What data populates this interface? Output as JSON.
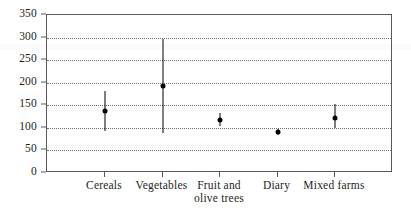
{
  "chart_data": {
    "type": "scatter",
    "title": "",
    "subtitle": "",
    "xlabel": "",
    "ylabel": "",
    "grid": true,
    "legend": false,
    "legend_position": "none",
    "ylim": [
      0,
      350
    ],
    "yticks": [
      0,
      50,
      100,
      150,
      200,
      250,
      300,
      350
    ],
    "ytick_labels": [
      "0",
      "50",
      "100",
      "150",
      "200",
      "250",
      "300",
      "350"
    ],
    "categories": [
      "Cereals",
      "Vegetables",
      "Fruit and\nolive trees",
      "Diary",
      "Mixed farms"
    ],
    "series": [
      {
        "name": "mean",
        "values": [
          138,
          192,
          118,
          91,
          121
        ],
        "errors_low": [
          93,
          88,
          105,
          85,
          100
        ],
        "errors_high": [
          182,
          296,
          132,
          98,
          152
        ]
      }
    ],
    "marker": "filled-circle",
    "errorbar_style": "vertical-line",
    "colors": {
      "marker": "#000000",
      "errorbar": "#000000",
      "gridline": "#6d6e71",
      "axis": "#58595b",
      "text": "#231f20",
      "background": "#ffffff"
    }
  },
  "axes": {
    "y_ticks": [
      {
        "label": "350",
        "value": 350
      },
      {
        "label": "300",
        "value": 300
      },
      {
        "label": "250",
        "value": 250
      },
      {
        "label": "200",
        "value": 200
      },
      {
        "label": "150",
        "value": 150
      },
      {
        "label": "100",
        "value": 100
      },
      {
        "label": "50",
        "value": 50
      },
      {
        "label": "0",
        "value": 0
      }
    ],
    "x_ticks": [
      {
        "label": "Cereals"
      },
      {
        "label": "Vegetables"
      },
      {
        "label": "Fruit and\nolive trees"
      },
      {
        "label": "Diary"
      },
      {
        "label": "Mixed farms"
      }
    ]
  }
}
